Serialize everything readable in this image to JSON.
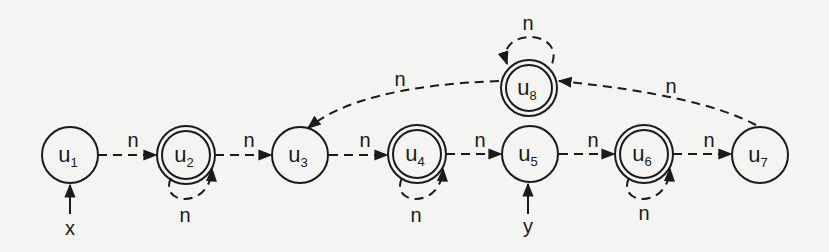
{
  "diagram": {
    "type": "shape-graph",
    "colors": {
      "stroke": "#1a1a1a",
      "background": "#f4f4f2"
    },
    "nodes": [
      {
        "id": "u1",
        "base": "u",
        "sub": "1",
        "summary": false,
        "cx": 70,
        "cy": 155
      },
      {
        "id": "u2",
        "base": "u",
        "sub": "2",
        "summary": true,
        "cx": 186,
        "cy": 154
      },
      {
        "id": "u3",
        "base": "u",
        "sub": "3",
        "summary": false,
        "cx": 300,
        "cy": 155
      },
      {
        "id": "u4",
        "base": "u",
        "sub": "4",
        "summary": true,
        "cx": 417,
        "cy": 154
      },
      {
        "id": "u5",
        "base": "u",
        "sub": "5",
        "summary": false,
        "cx": 530,
        "cy": 154
      },
      {
        "id": "u6",
        "base": "u",
        "sub": "6",
        "summary": true,
        "cx": 644,
        "cy": 154
      },
      {
        "id": "u7",
        "base": "u",
        "sub": "7",
        "summary": false,
        "cx": 760,
        "cy": 155
      },
      {
        "id": "u8",
        "base": "u",
        "sub": "8",
        "summary": true,
        "cx": 529,
        "cy": 88
      }
    ],
    "edges": [
      {
        "from": "u1",
        "to": "u2",
        "label": "n"
      },
      {
        "from": "u2",
        "to": "u3",
        "label": "n"
      },
      {
        "from": "u3",
        "to": "u4",
        "label": "n"
      },
      {
        "from": "u4",
        "to": "u5",
        "label": "n"
      },
      {
        "from": "u5",
        "to": "u6",
        "label": "n"
      },
      {
        "from": "u6",
        "to": "u7",
        "label": "n"
      },
      {
        "from": "u7",
        "to": "u8",
        "label": "n"
      },
      {
        "from": "u8",
        "to": "u3",
        "label": "n"
      },
      {
        "from": "u2",
        "to": "u2",
        "label": "n"
      },
      {
        "from": "u4",
        "to": "u4",
        "label": "n"
      },
      {
        "from": "u6",
        "to": "u6",
        "label": "n"
      },
      {
        "from": "u8",
        "to": "u8",
        "label": "n"
      }
    ],
    "pointers": [
      {
        "var": "x",
        "to": "u1"
      },
      {
        "var": "y",
        "to": "u5"
      }
    ]
  }
}
